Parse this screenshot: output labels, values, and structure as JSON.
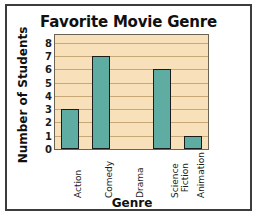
{
  "figure": {
    "background": "#ffffff",
    "border_color": "#3c3c3c"
  },
  "chart_data": {
    "type": "bar",
    "title": "Favorite Movie Genre",
    "xlabel": "Genre",
    "ylabel": "Number of Students",
    "categories": [
      "Action",
      "Comedy",
      "Drama",
      "Science Fiction",
      "Animation"
    ],
    "values": [
      3,
      7,
      0,
      6,
      1
    ],
    "yticks": [
      0,
      1,
      2,
      3,
      4,
      5,
      6,
      7,
      8
    ],
    "ylim": [
      0,
      8.6
    ],
    "grid": true,
    "grid_axis": "y",
    "legend": false,
    "bar_color": "#5fada2",
    "bar_edge_color": "#1b1b1b",
    "plot_background": "#f7e0ba",
    "gridline_color": "#c9a877",
    "plot_border_color": "#6d6352"
  }
}
